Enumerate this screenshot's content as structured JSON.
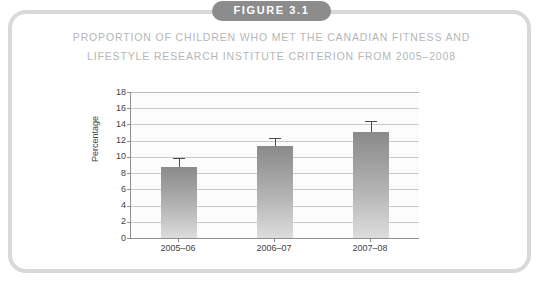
{
  "badge": {
    "label": "FIGURE 3.1",
    "background_color": "#8c8c8c",
    "text_color": "#ffffff"
  },
  "title": {
    "line1": "PROPORTION OF CHILDREN WHO MET THE CANADIAN FITNESS AND",
    "line2": "LIFESTYLE RESEARCH INSTITUTE CRITERION FROM 2005–2008",
    "color": "#b6b6b6"
  },
  "card": {
    "border_color": "#d9d9d9",
    "background_color": "#ffffff"
  },
  "chart_data": {
    "type": "bar",
    "title": "PROPORTION OF CHILDREN WHO MET THE CANADIAN FITNESS AND LIFESTYLE RESEARCH INSTITUTE CRITERION FROM 2005–2008",
    "xlabel": "",
    "ylabel": "Percentage",
    "categories": [
      "2005–06",
      "2006–07",
      "2007–08"
    ],
    "values": [
      8.7,
      11.3,
      13.1
    ],
    "error_upper": [
      1.2,
      1.0,
      1.3
    ],
    "error_bar_direction": "upper-only",
    "ylim": [
      0,
      18
    ],
    "ytick_step": 2,
    "ytick_labels": [
      "0",
      "2",
      "4",
      "6",
      "8",
      "10",
      "12",
      "14",
      "16",
      "18"
    ],
    "grid": true,
    "grid_axis": "y",
    "legend": "none",
    "bar_color_top": "#8a8a8a",
    "bar_color_bottom": "#dcdcdc",
    "error_bar_color": "#4a4a4a",
    "axis_color": "#8e8e8e",
    "gridline_color": "#c9c9c9",
    "plot_background": "#fcfcfc"
  }
}
